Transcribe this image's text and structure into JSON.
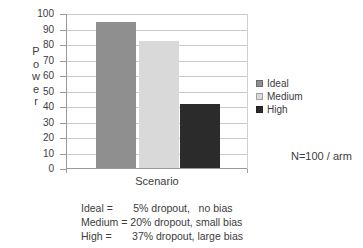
{
  "chart_data": {
    "type": "bar",
    "categories": [
      "Ideal",
      "Medium",
      "High"
    ],
    "values": [
      94,
      82,
      41
    ],
    "bar_colors": [
      "#8f8f8f",
      "#d9d9d9",
      "#2b2b2b"
    ],
    "title": "",
    "xlabel": "Scenario",
    "ylabel": "Power",
    "ylim": [
      0,
      100
    ],
    "ytick_step": 10,
    "grid": "horizontal",
    "legend": {
      "position": "right",
      "items": [
        {
          "label": "Ideal",
          "color": "#8f8f8f"
        },
        {
          "label": "Medium",
          "color": "#d9d9d9"
        },
        {
          "label": "High",
          "color": "#2b2b2b"
        }
      ]
    },
    "annotation": "N=100 / arm",
    "footnotes": [
      "Ideal =       5% dropout,   no bias",
      "Medium = 20% dropout, small bias",
      "High =       37% dropout, large bias"
    ]
  },
  "colors": {
    "gridline": "#c9c9c9",
    "axis": "#9a9a9a",
    "text": "#3c3c3c",
    "background": "#ffffff"
  }
}
